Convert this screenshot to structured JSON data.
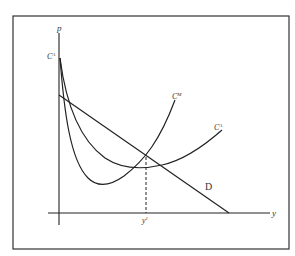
{
  "diagram": {
    "type": "economics cost-demand curve diagram",
    "axes": {
      "vertical_label": "p",
      "horizontal_label": "y"
    },
    "curves": [
      {
        "id": "average-cost",
        "label_base": "C",
        "label_sup": "A",
        "description": "average cost curve, U-shaped, high at origin, minimum near right"
      },
      {
        "id": "marginal-cost",
        "label_base": "C",
        "label_sup": "M",
        "description": "marginal cost curve, U-shaped, steeper, rising sharply"
      },
      {
        "id": "demand",
        "label": "D",
        "description": "downward sloping straight demand line"
      }
    ],
    "top_left_label": {
      "base": "C",
      "sup": "A"
    },
    "marked_quantity": {
      "base": "y",
      "sup": "1"
    },
    "colors": {
      "line": "#222222",
      "frame": "#333333",
      "background": "#ffffff"
    }
  }
}
